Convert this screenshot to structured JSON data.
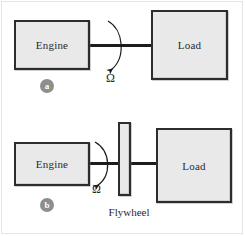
{
  "figure": {
    "width": 245,
    "height": 236,
    "background_color": "#ffffff",
    "frame_color": "#e4e4e4",
    "block_fill_color": "#e9e9e9",
    "block_border_color": "#2d2d2d",
    "shaft_color": "#1c1c1c",
    "badge_color": "#8e8e8e",
    "text_color": "#2b2b2b"
  },
  "panels": [
    {
      "id": "a",
      "badge_label": "a",
      "engine": {
        "label": "Engine"
      },
      "load": {
        "label": "Load"
      },
      "speed": {
        "label": "Ω"
      },
      "flywheel": null
    },
    {
      "id": "b",
      "badge_label": "b",
      "engine": {
        "label": "Engine"
      },
      "load": {
        "label": "Load"
      },
      "speed": {
        "label": "Ω"
      },
      "flywheel": {
        "label": "Flywheel"
      }
    }
  ]
}
